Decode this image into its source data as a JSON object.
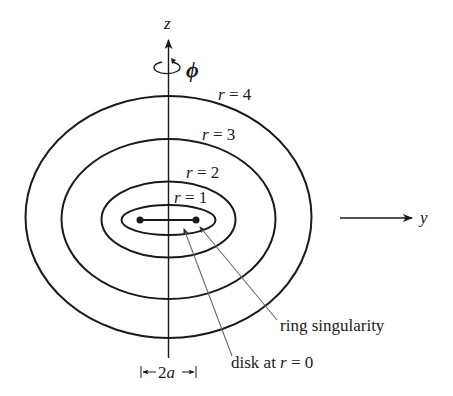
{
  "figure": {
    "axes": {
      "z_label": "z",
      "y_label": "y",
      "phi_label": "ϕ"
    },
    "contours": [
      {
        "label_var": "r",
        "label_eq": " = 4",
        "rx": 143,
        "ry": 121
      },
      {
        "label_var": "r",
        "label_eq": " = 3",
        "rx": 107,
        "ry": 80
      },
      {
        "label_var": "r",
        "label_eq": " = 2",
        "rx": 67,
        "ry": 38
      },
      {
        "label_var": "r",
        "label_eq": " = 1",
        "rx": 47,
        "ry": 15
      }
    ],
    "annotations": {
      "ring": "ring singularity",
      "disk_prefix": "disk at ",
      "disk_var": "r",
      "disk_suffix": " = 0",
      "width_prefix": "2",
      "width_var": "a"
    },
    "colors": {
      "stroke": "#1a1a1a",
      "pointer": "#777777"
    }
  }
}
